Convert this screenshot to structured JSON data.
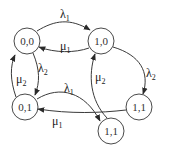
{
  "diagram": {
    "type": "state-transition-diagram",
    "colors": {
      "stroke": "#3a3a3a",
      "text": "#222222",
      "background": "#ffffff"
    },
    "nodes": [
      {
        "id": "n00",
        "label": "0,0",
        "cx": 27,
        "cy": 41,
        "r": 13
      },
      {
        "id": "n10",
        "label": "1,0",
        "cx": 101,
        "cy": 41,
        "r": 13
      },
      {
        "id": "n01",
        "label": "0,1",
        "cx": 25,
        "cy": 107,
        "r": 13
      },
      {
        "id": "n11a",
        "label": "1,1",
        "cx": 139,
        "cy": 107,
        "r": 13
      },
      {
        "id": "n11b",
        "label": "1,1",
        "cx": 111,
        "cy": 131,
        "r": 13
      }
    ],
    "edges": [
      {
        "from": "n00",
        "to": "n10",
        "symbol": "λ",
        "sub": "1"
      },
      {
        "from": "n10",
        "to": "n00",
        "symbol": "μ",
        "sub": "1"
      },
      {
        "from": "n00",
        "to": "n01",
        "symbol": "λ",
        "sub": "2"
      },
      {
        "from": "n01",
        "to": "n00",
        "symbol": "μ",
        "sub": "2"
      },
      {
        "from": "n10",
        "to": "n11a",
        "symbol": "λ",
        "sub": "2"
      },
      {
        "from": "n11b",
        "to": "n10",
        "symbol": "μ",
        "sub": "2"
      },
      {
        "from": "n01",
        "to": "n11b",
        "symbol": "λ",
        "sub": "1"
      },
      {
        "from": "n11a",
        "to": "n01",
        "symbol": "μ",
        "sub": "1"
      }
    ]
  }
}
